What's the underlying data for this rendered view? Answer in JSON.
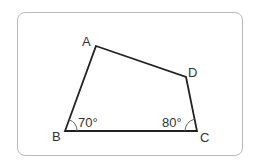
{
  "diagram": {
    "type": "quadrilateral",
    "vertices": [
      {
        "name": "A",
        "x": 96,
        "y": 46,
        "label_x": 82,
        "label_y": 46
      },
      {
        "name": "B",
        "x": 65,
        "y": 131,
        "label_x": 52,
        "label_y": 141
      },
      {
        "name": "C",
        "x": 197,
        "y": 131,
        "label_x": 200,
        "label_y": 142
      },
      {
        "name": "D",
        "x": 186,
        "y": 77,
        "label_x": 188,
        "label_y": 77
      }
    ],
    "angles": [
      {
        "vertex": "B",
        "value": "70°"
      },
      {
        "vertex": "C",
        "value": "80°"
      }
    ],
    "labels": {
      "A": "A",
      "B": "B",
      "C": "C",
      "D": "D",
      "angle_b": "70°",
      "angle_c": "80°"
    },
    "colors": {
      "stroke": "#222222",
      "frame": "#b9b9b9",
      "text": "#333333"
    }
  }
}
